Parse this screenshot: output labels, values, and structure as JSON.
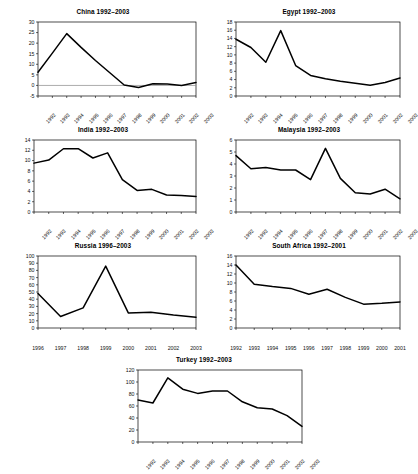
{
  "figure": {
    "type": "multi-panel-line-chart",
    "panel_count": 7,
    "background": "#ffffff",
    "line_color": "#000000"
  },
  "chart_data": [
    {
      "id": "china",
      "type": "line",
      "title": "China 1992–2003",
      "xlabel": "",
      "ylabel": "",
      "categories": [
        "1992",
        "1993",
        "1994",
        "1995",
        "1996",
        "1997",
        "1998",
        "1999",
        "2000",
        "2001",
        "2002",
        "2003"
      ],
      "values": [
        6.2,
        15.3,
        24.5,
        18.0,
        11.8,
        6.0,
        0.2,
        -1.0,
        0.8,
        0.7,
        0.0,
        1.4
      ],
      "ylim": [
        -5,
        30
      ],
      "yticks": [
        "30",
        "25",
        "20",
        "15",
        "10",
        "5",
        "0",
        "-5"
      ],
      "grid": false,
      "legend": "none",
      "tick_label_rotation": -45
    },
    {
      "id": "egypt",
      "type": "line",
      "title": "Egypt 1992–2003",
      "xlabel": "",
      "ylabel": "",
      "categories": [
        "1992",
        "1993",
        "1994",
        "1995",
        "1996",
        "1997",
        "1998",
        "1999",
        "2000",
        "2001",
        "2002",
        "2003"
      ],
      "values": [
        13.8,
        11.8,
        8.2,
        15.9,
        7.4,
        5.0,
        4.2,
        3.6,
        3.1,
        2.6,
        3.3,
        4.4
      ],
      "ylim": [
        0,
        18
      ],
      "yticks": [
        "18",
        "16",
        "14",
        "12",
        "10",
        "8",
        "6",
        "4",
        "2",
        "0"
      ],
      "grid": false,
      "legend": "none",
      "tick_label_rotation": -45
    },
    {
      "id": "india",
      "type": "line",
      "title": "India 1992–2003",
      "xlabel": "",
      "ylabel": "",
      "categories": [
        "1992",
        "1993",
        "1994",
        "1995",
        "1996",
        "1997",
        "1998",
        "1999",
        "2000",
        "2001",
        "2002",
        "2003"
      ],
      "values": [
        9.5,
        10.1,
        12.3,
        12.3,
        10.5,
        11.5,
        6.3,
        4.2,
        4.4,
        3.3,
        3.2,
        3.0
      ],
      "ylim": [
        0,
        14
      ],
      "yticks": [
        "14",
        "12",
        "10",
        "8",
        "6",
        "4",
        "2",
        "0"
      ],
      "grid": false,
      "legend": "none",
      "tick_label_rotation": -45
    },
    {
      "id": "malaysia",
      "type": "line",
      "title": "Malaysia 1992–2003",
      "xlabel": "",
      "ylabel": "",
      "categories": [
        "1992",
        "1993",
        "1994",
        "1995",
        "1996",
        "1997",
        "1998",
        "1999",
        "2000",
        "2001",
        "2002",
        "2003"
      ],
      "values": [
        4.7,
        3.6,
        3.7,
        3.5,
        3.5,
        2.7,
        5.3,
        2.8,
        1.6,
        1.5,
        1.9,
        1.1
      ],
      "ylim": [
        0,
        6
      ],
      "yticks": [
        "6",
        "5",
        "4",
        "3",
        "2",
        "1",
        "0"
      ],
      "grid": false,
      "legend": "none",
      "tick_label_rotation": -45
    },
    {
      "id": "russia",
      "type": "line",
      "title": "Russia 1996–2003",
      "xlabel": "",
      "ylabel": "",
      "categories": [
        "1996",
        "1997",
        "1998",
        "1999",
        "2000",
        "2001",
        "2002",
        "2003"
      ],
      "values": [
        48,
        16,
        28,
        86,
        21,
        22,
        18,
        15
      ],
      "ylim": [
        0,
        100
      ],
      "yticks": [
        "100",
        "90",
        "80",
        "70",
        "60",
        "50",
        "40",
        "30",
        "20",
        "10",
        "0"
      ],
      "grid": false,
      "legend": "none",
      "tick_label_rotation": 0
    },
    {
      "id": "south-africa",
      "type": "line",
      "title": "South Africa 1992–2001",
      "xlabel": "",
      "ylabel": "",
      "categories": [
        "1992",
        "1993",
        "1994",
        "1995",
        "1996",
        "1997",
        "1998",
        "1999",
        "2000",
        "2001"
      ],
      "values": [
        14.0,
        9.7,
        9.2,
        8.8,
        7.5,
        8.6,
        6.8,
        5.3,
        5.5,
        5.8
      ],
      "ylim": [
        0,
        16
      ],
      "yticks": [
        "16",
        "14",
        "12",
        "10",
        "8",
        "6",
        "4",
        "2",
        "0"
      ],
      "grid": false,
      "legend": "none",
      "tick_label_rotation": 0
    },
    {
      "id": "turkey",
      "type": "line",
      "title": "Turkey 1992–2003",
      "xlabel": "",
      "ylabel": "",
      "categories": [
        "1992",
        "1993",
        "1994",
        "1995",
        "1996",
        "1997",
        "1998",
        "1999",
        "2000",
        "2001",
        "2002",
        "2003"
      ],
      "values": [
        70,
        65,
        107,
        88,
        81,
        85,
        85,
        67,
        57,
        55,
        44,
        26
      ],
      "ylim": [
        0,
        120
      ],
      "yticks": [
        "120",
        "100",
        "80",
        "60",
        "40",
        "20",
        "0"
      ],
      "grid": false,
      "legend": "none",
      "tick_label_rotation": -45
    }
  ]
}
